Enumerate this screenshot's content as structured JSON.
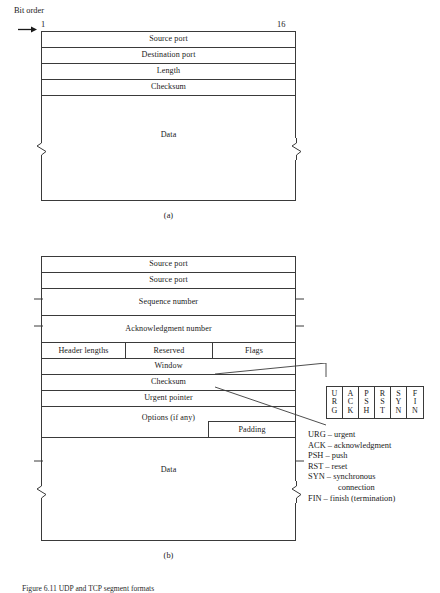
{
  "figure": {
    "bit_order_label": "Bit order",
    "bit_start": "1",
    "bit_end": "16",
    "caption_a": "(a)",
    "caption_b": "(b)",
    "figure_caption": "Figure 6.11 UDP and TCP segment formats"
  },
  "udp": {
    "title": "(a)",
    "rows": [
      {
        "label": "Source port"
      },
      {
        "label": "Destination port"
      },
      {
        "label": "Length"
      },
      {
        "label": "Checksum"
      },
      {
        "label": "Data"
      }
    ]
  },
  "tcp": {
    "title": "(b)",
    "rows": [
      {
        "label": "Source port"
      },
      {
        "label": "Source port"
      },
      {
        "label": "Sequence number"
      },
      {
        "label": "Acknowledgment number"
      }
    ],
    "split_row": {
      "header_lengths": "Header lengths",
      "reserved": "Reserved",
      "flags": "Flags"
    },
    "rows_lower": [
      {
        "label": "Window"
      },
      {
        "label": "Checksum"
      },
      {
        "label": "Urgent pointer"
      },
      {
        "label": "Options (if any)"
      }
    ],
    "padding_label": "Padding",
    "data_label": "Data"
  },
  "flags_detail": {
    "cells": [
      {
        "l1": "U",
        "l2": "R",
        "l3": "G"
      },
      {
        "l1": "A",
        "l2": "C",
        "l3": "K"
      },
      {
        "l1": "P",
        "l2": "S",
        "l3": "H"
      },
      {
        "l1": "R",
        "l2": "S",
        "l3": "T"
      },
      {
        "l1": "S",
        "l2": "Y",
        "l3": "N"
      },
      {
        "l1": "F",
        "l2": "I",
        "l3": "N"
      }
    ]
  },
  "legend": {
    "entries": [
      {
        "text": "URG – urgent"
      },
      {
        "text": "ACK – acknowledgment"
      },
      {
        "text": "PSH – push"
      },
      {
        "text": "RST – reset"
      },
      {
        "text": "SYN – synchronous"
      },
      {
        "text": "connection",
        "indent": true
      },
      {
        "text": "FIN – finish (termination)"
      }
    ]
  },
  "colors": {
    "line": "#3a3a3a",
    "text": "#1a1a1a",
    "background": "#ffffff"
  }
}
